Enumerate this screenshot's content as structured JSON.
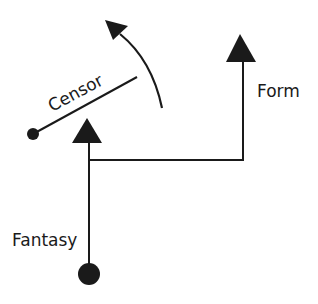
{
  "diagram": {
    "labels": {
      "censor": "Censor",
      "form": "Form",
      "fantasy": "Fantasy"
    },
    "colors": {
      "ink": "#1a1a1a",
      "background": "#ffffff"
    },
    "nodes": [
      {
        "id": "fantasy-origin",
        "shape": "circle",
        "cx": 89,
        "cy": 274,
        "r": 11
      },
      {
        "id": "censor-pivot",
        "shape": "circle",
        "cx": 33,
        "cy": 134,
        "r": 6
      }
    ],
    "arrows": [
      {
        "id": "fantasy-arrow",
        "from": [
          89,
          264
        ],
        "to": [
          89,
          118
        ]
      },
      {
        "id": "form-arrow",
        "path": [
          [
            89,
            160
          ],
          [
            243,
            160
          ],
          [
            243,
            34
          ]
        ]
      },
      {
        "id": "censor-swing-arrow",
        "type": "curved",
        "from": [
          162,
          108
        ],
        "to": [
          108,
          22
        ]
      }
    ],
    "lines": [
      {
        "id": "censor-bar",
        "from": [
          33,
          134
        ],
        "to": [
          137,
          77
        ]
      }
    ]
  }
}
